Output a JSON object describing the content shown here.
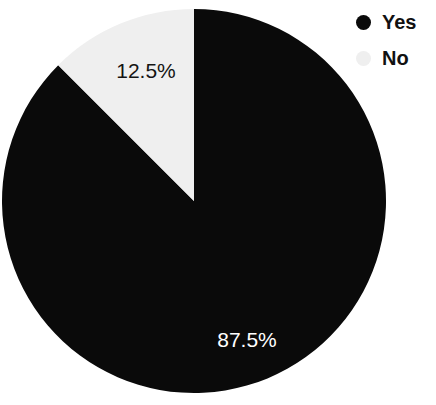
{
  "chart_data": {
    "type": "pie",
    "title": "",
    "subtitle": "",
    "xlabel": "",
    "ylabel": "",
    "categories": [
      "Yes",
      "No"
    ],
    "values": [
      87.5,
      12.5
    ],
    "slices": [
      {
        "label": "Yes",
        "value": 87.5,
        "value_text": "87.5%",
        "color": "#0a0a0a",
        "label_color": "#ffffff",
        "start_angle_deg": 0,
        "end_angle_deg": 315
      },
      {
        "label": "No",
        "value": 12.5,
        "value_text": "12.5%",
        "color": "#efefef",
        "label_color": "#141414",
        "start_angle_deg": 315,
        "end_angle_deg": 360
      }
    ],
    "units": "percent",
    "total": 100,
    "start_angle_deg": 0,
    "direction": "clockwise",
    "grid": false,
    "legend_position": "top-right",
    "legend": [
      {
        "label": "Yes",
        "color": "#0a0a0a"
      },
      {
        "label": "No",
        "color": "#efefef"
      }
    ],
    "annotations": [],
    "background_color": "#ffffff"
  },
  "geometry": {
    "center_x": 194,
    "center_y": 201,
    "radius": 192
  }
}
